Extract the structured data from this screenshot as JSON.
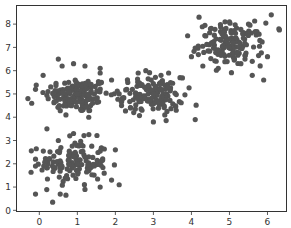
{
  "chart_data": {
    "type": "scatter",
    "title": "",
    "xlabel": "",
    "ylabel": "",
    "xlim": [
      -0.6,
      6.5
    ],
    "ylim": [
      -0.05,
      8.8
    ],
    "grid": false,
    "legend": null,
    "x_ticks": [
      "0",
      "1",
      "2",
      "3",
      "4",
      "5",
      "6"
    ],
    "y_ticks": [
      "0",
      "1",
      "2",
      "3",
      "4",
      "5",
      "6",
      "7",
      "8"
    ],
    "marker_color": "#555555",
    "marker_size": 2.6,
    "clusters": [
      {
        "name": "cluster-1",
        "center": [
          1.0,
          4.95
        ],
        "std": [
          0.42,
          0.38
        ],
        "n": 150
      },
      {
        "name": "cluster-2",
        "center": [
          0.9,
          2.05
        ],
        "std": [
          0.45,
          0.5
        ],
        "n": 130
      },
      {
        "name": "cluster-3",
        "center": [
          2.95,
          4.95
        ],
        "std": [
          0.42,
          0.38
        ],
        "n": 130
      },
      {
        "name": "cluster-4",
        "center": [
          5.05,
          7.15
        ],
        "std": [
          0.42,
          0.45
        ],
        "n": 140
      }
    ],
    "series": [
      {
        "name": "points",
        "points": [
          [
            -0.3,
            4.8
          ],
          [
            -0.2,
            4.6
          ],
          [
            -0.1,
            5.2
          ],
          [
            0.1,
            5.8
          ],
          [
            0.3,
            5.3
          ],
          [
            0.5,
            6.5
          ],
          [
            0.6,
            6.2
          ],
          [
            0.9,
            6.3
          ],
          [
            1.2,
            6.2
          ],
          [
            1.6,
            6.1
          ],
          [
            1.6,
            5.9
          ],
          [
            1.9,
            5.6
          ],
          [
            1.0,
            5.0
          ],
          [
            0.8,
            4.7
          ],
          [
            1.4,
            4.6
          ],
          [
            1.1,
            4.3
          ],
          [
            0.7,
            4.1
          ],
          [
            1.3,
            4.0
          ],
          [
            -0.1,
            2.2
          ],
          [
            -0.1,
            1.9
          ],
          [
            0.2,
            3.5
          ],
          [
            0.5,
            3.0
          ],
          [
            0.8,
            3.2
          ],
          [
            0.9,
            3.3
          ],
          [
            -0.1,
            0.7
          ],
          [
            0.35,
            0.35
          ],
          [
            0.55,
            0.7
          ],
          [
            0.7,
            0.65
          ],
          [
            1.2,
            0.9
          ],
          [
            1.6,
            1.0
          ],
          [
            2.0,
            2.6
          ],
          [
            2.1,
            1.1
          ],
          [
            1.9,
            1.3
          ],
          [
            1.0,
            2.0
          ],
          [
            0.8,
            1.7
          ],
          [
            1.3,
            2.3
          ],
          [
            2.1,
            5.0
          ],
          [
            2.3,
            5.2
          ],
          [
            2.6,
            5.9
          ],
          [
            2.8,
            6.0
          ],
          [
            3.2,
            5.8
          ],
          [
            3.4,
            5.9
          ],
          [
            3.7,
            5.7
          ],
          [
            2.4,
            4.4
          ],
          [
            2.7,
            4.3
          ],
          [
            3.0,
            3.8
          ],
          [
            3.3,
            4.1
          ],
          [
            3.6,
            4.3
          ],
          [
            4.1,
            3.9
          ],
          [
            3.0,
            5.0
          ],
          [
            2.9,
            4.7
          ],
          [
            3.2,
            5.2
          ],
          [
            3.9,
            7.5
          ],
          [
            4.2,
            8.3
          ],
          [
            4.0,
            6.6
          ],
          [
            4.3,
            6.2
          ],
          [
            4.5,
            7.8
          ],
          [
            4.8,
            7.6
          ],
          [
            5.0,
            8.1
          ],
          [
            5.5,
            8.0
          ],
          [
            5.8,
            7.3
          ],
          [
            6.1,
            8.4
          ],
          [
            6.3,
            7.8
          ],
          [
            5.6,
            6.4
          ],
          [
            5.3,
            6.3
          ],
          [
            5.6,
            5.8
          ],
          [
            5.9,
            5.6
          ],
          [
            6.0,
            6.6
          ],
          [
            4.7,
            6.9
          ],
          [
            5.1,
            7.2
          ],
          [
            5.2,
            6.8
          ]
        ]
      }
    ]
  }
}
